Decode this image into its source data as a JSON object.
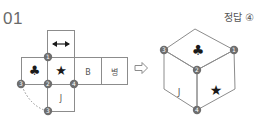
{
  "question": {
    "number": "01"
  },
  "answer": {
    "label": "정답",
    "choice": "④"
  },
  "net": {
    "top_face": {
      "symbol": "◄►",
      "icon": "double-arrow-icon"
    },
    "row_faces": [
      {
        "symbol": "♣",
        "icon": "club-icon"
      },
      {
        "symbol": "★",
        "icon": "star-icon"
      },
      {
        "symbol": "B"
      },
      {
        "symbol": "병"
      }
    ],
    "bottom_face": {
      "symbol": "J"
    },
    "vertex_markers": [
      "1",
      "2",
      "3",
      "4",
      "3"
    ]
  },
  "arrow": {
    "icon": "right-arrow-icon"
  },
  "cube": {
    "top_face": {
      "symbol": "♣"
    },
    "left_face": {
      "symbol": "J"
    },
    "right_face": {
      "symbol": "★"
    },
    "vertex_markers": [
      "3",
      "1",
      "2",
      "4"
    ]
  },
  "colors": {
    "line": "#8c8c8c",
    "marker": "#6e6e6e",
    "marker_text": "#ffffff",
    "symbol": "#1a1a1a"
  }
}
